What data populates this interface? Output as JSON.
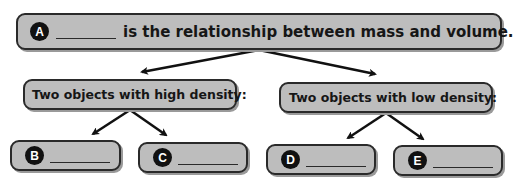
{
  "diagram": {
    "type": "concept-map",
    "top": {
      "label": "A",
      "blank": "________",
      "text": "is the relationship between mass and volume."
    },
    "branches": [
      {
        "text": "Two objects with high density:",
        "children": [
          {
            "label": "B",
            "blank": "________"
          },
          {
            "label": "C",
            "blank": "________"
          }
        ]
      },
      {
        "text": "Two objects with low density:",
        "children": [
          {
            "label": "D",
            "blank": "________"
          },
          {
            "label": "E",
            "blank": "________"
          }
        ]
      }
    ],
    "colors": {
      "box_fill": "#bdbdbd",
      "box_border": "#2a2a2a",
      "badge": "#111111",
      "arrow": "#111111"
    }
  }
}
